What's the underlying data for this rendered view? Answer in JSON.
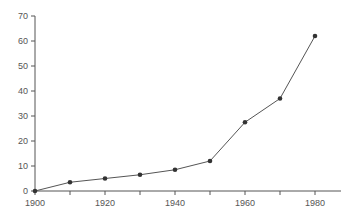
{
  "chart_data": {
    "type": "line",
    "title": "",
    "xlabel": "",
    "ylabel": "",
    "x": [
      1900,
      1910,
      1920,
      1930,
      1940,
      1950,
      1960,
      1970,
      1980
    ],
    "series": [
      {
        "name": "series",
        "values": [
          0,
          3.5,
          5,
          6.5,
          8.5,
          12,
          27.5,
          37,
          62
        ]
      }
    ],
    "xlim": [
      1900,
      1990
    ],
    "ylim": [
      0,
      70
    ],
    "x_tick_labels": [
      "1900",
      "1920",
      "1940",
      "1960",
      "1980"
    ],
    "x_ticks": [
      1900,
      1910,
      1920,
      1930,
      1940,
      1950,
      1960,
      1970,
      1980,
      1990
    ],
    "y_ticks": [
      0,
      10,
      20,
      30,
      40,
      50,
      60,
      70
    ],
    "y_tick_labels": [
      "0",
      "10",
      "20",
      "30",
      "40",
      "50",
      "60",
      "70"
    ],
    "grid": false,
    "legend": null,
    "colors": {
      "line": "#555555",
      "marker": "#333333",
      "axis": "#555555"
    }
  }
}
